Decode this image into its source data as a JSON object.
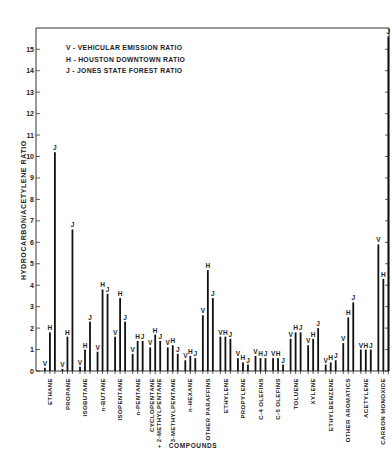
{
  "chart_data": {
    "type": "bar",
    "title": "",
    "xlabel": "COMPOUNDS",
    "ylabel": "HYDROCARBON/ACETYLENE RATIO",
    "ylim": [
      0,
      15.9
    ],
    "yticks": [
      0,
      1,
      2,
      3,
      4,
      5,
      6,
      7,
      8,
      9,
      10,
      11,
      12,
      13,
      14,
      15
    ],
    "grid": false,
    "legend_position": "top-left inside",
    "legend": [
      {
        "key": "V",
        "label": "V  -  VEHICULAR EMISSION RATIO"
      },
      {
        "key": "H",
        "label": "H  -  HOUSTON DOWNTOWN RATIO"
      },
      {
        "key": "J",
        "label": "J  -  JONES STATE FOREST RATIO"
      }
    ],
    "categories": [
      "ETHANE",
      "PROPANE",
      "ISOBUTANE",
      "n-BUTANE",
      "ISOPENTANE",
      "n-PENTANE",
      "CYCLOPENTANE\n+ 2-METHYLPENTANE",
      "3-METHYLPENTANE",
      "n-HEXANE",
      "OTHER PARAFFINS",
      "ETHYLENE",
      "PROPYLENE",
      "C-4 OLEFINS",
      "C-5 OLEFINS",
      "TOLUENE",
      "XYLENE",
      "ETHYLBENZENE",
      "OTHER AROMATICS",
      "ACETYLENE",
      "CARBON MONOXIDE"
    ],
    "series": [
      {
        "name": "V",
        "label": "Vehicular Emission Ratio",
        "values": [
          0.15,
          0.1,
          0.2,
          0.9,
          1.6,
          0.8,
          1.1,
          1.1,
          0.5,
          2.6,
          1.6,
          0.6,
          0.7,
          0.6,
          1.5,
          1.2,
          0.3,
          1.3,
          1.0,
          5.9
        ]
      },
      {
        "name": "H",
        "label": "Houston Downtown Ratio",
        "values": [
          1.8,
          1.6,
          1.0,
          3.8,
          3.4,
          1.4,
          1.7,
          1.2,
          0.7,
          4.7,
          1.6,
          0.4,
          0.6,
          0.6,
          1.8,
          1.5,
          0.4,
          2.5,
          1.0,
          4.3
        ]
      },
      {
        "name": "J",
        "label": "Jones State Forest Ratio",
        "values": [
          10.2,
          6.6,
          2.3,
          3.6,
          2.3,
          1.4,
          1.4,
          0.8,
          0.6,
          3.4,
          1.5,
          0.3,
          0.6,
          0.3,
          1.8,
          2.0,
          0.5,
          3.2,
          1.0,
          15.6
        ]
      }
    ]
  }
}
